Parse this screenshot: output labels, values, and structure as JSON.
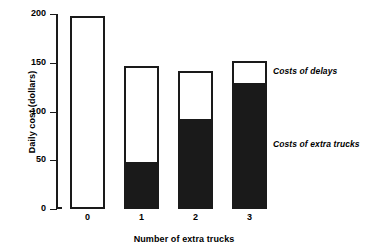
{
  "chart_data": {
    "type": "bar",
    "subtype": "stacked-bar",
    "title": "",
    "xlabel": "Number of extra trucks",
    "ylabel": "Daily cost (dollars)",
    "categories": [
      "0",
      "1",
      "2",
      "3"
    ],
    "ylim": [
      0,
      200
    ],
    "yticks": [
      0,
      50,
      100,
      150,
      200
    ],
    "ytick_labels": [
      "0",
      "50",
      "100",
      "150",
      "200"
    ],
    "grid": false,
    "legend_position": "inline-annotations",
    "series": [
      {
        "name": "Costs of extra trucks",
        "color": "#1a1a1a",
        "values": [
          0,
          46,
          90,
          127
        ]
      },
      {
        "name": "Costs of delays",
        "color": "#ffffff",
        "values": [
          196,
          99,
          50,
          23
        ]
      }
    ],
    "totals": [
      196,
      145,
      140,
      150
    ],
    "annotations": [
      {
        "text": "Costs of delays",
        "x": 3,
        "y": 138
      },
      {
        "text": "Costs of extra trucks",
        "x": 3,
        "y": 63
      }
    ]
  },
  "axis": {
    "y_title": "Daily cost (dollars)",
    "x_title": "Number of extra trucks"
  }
}
